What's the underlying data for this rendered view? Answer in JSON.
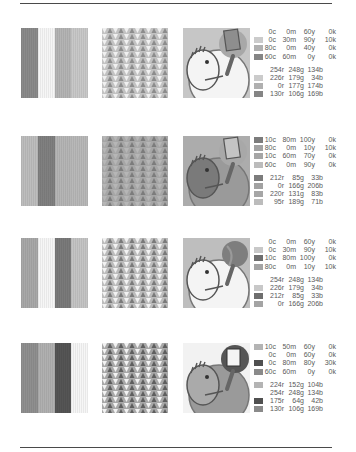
{
  "page": {
    "rules": [
      "top",
      "bottom"
    ]
  },
  "rows": [
    {
      "stripes": [
        "#8a8a8a",
        "#f6f6f6",
        "#b4b4b4",
        "#c8c8c8"
      ],
      "pattern": {
        "tri_dark": "#8c8c8c",
        "tri_light": "#f0f0f0",
        "bg": "#c2c2c2"
      },
      "illustration": {
        "bg": "#c6c6c6",
        "body": "#f4f4f4",
        "ring": "#f4f4f4",
        "accent": "#8e8e8e",
        "prop": "paddle"
      },
      "cmyk": [
        {
          "swatch": "#ffffff",
          "c": "0c",
          "m": "0m",
          "y": "60y",
          "k": "0k"
        },
        {
          "swatch": "#cbcbcb",
          "c": "0c",
          "m": "30m",
          "y": "90y",
          "k": "10k"
        },
        {
          "swatch": "#b0b0b0",
          "c": "80c",
          "m": "0m",
          "y": "40y",
          "k": "0k"
        },
        {
          "swatch": "#858585",
          "c": "60c",
          "m": "60m",
          "y": "0y",
          "k": "0k"
        }
      ],
      "rgb": [
        {
          "swatch": "#ffffff",
          "r": "254r",
          "g": "248g",
          "b": "134b"
        },
        {
          "swatch": "#cbcbcb",
          "r": "226r",
          "g": "179g",
          "b": "34b"
        },
        {
          "swatch": "#b0b0b0",
          "r": "0r",
          "g": "177g",
          "b": "174b"
        },
        {
          "swatch": "#858585",
          "r": "130r",
          "g": "106g",
          "b": "169b"
        }
      ]
    },
    {
      "stripes": [
        "#bdbdbd",
        "#808080",
        "#b5b5b5",
        "#b8b8b8"
      ],
      "pattern": {
        "tri_dark": "#7c7c7c",
        "tri_light": "#b6b6b6",
        "bg": "#a6a6a6"
      },
      "illustration": {
        "bg": "#acacac",
        "body": "#7a7a7a",
        "ring": "#9a9a9a",
        "accent": "#c4c4c4",
        "prop": "paddle"
      },
      "cmyk": [
        {
          "swatch": "#7c7c7c",
          "c": "10c",
          "m": "80m",
          "y": "100y",
          "k": "0k"
        },
        {
          "swatch": "#a2a2a2",
          "c": "80c",
          "m": "0m",
          "y": "10y",
          "k": "10k"
        },
        {
          "swatch": "#a6a6a6",
          "c": "10c",
          "m": "60m",
          "y": "70y",
          "k": "0k"
        },
        {
          "swatch": "#bcbcbc",
          "c": "60c",
          "m": "0m",
          "y": "90y",
          "k": "0k"
        }
      ],
      "rgb": [
        {
          "swatch": "#7c7c7c",
          "r": "212r",
          "g": "85g",
          "b": "33b"
        },
        {
          "swatch": "#a2a2a2",
          "r": "0r",
          "g": "166g",
          "b": "206b"
        },
        {
          "swatch": "#a6a6a6",
          "r": "220r",
          "g": "131g",
          "b": "83b"
        },
        {
          "swatch": "#bcbcbc",
          "r": "95r",
          "g": "189g",
          "b": "71b"
        }
      ]
    },
    {
      "stripes": [
        "#a8a8a8",
        "#f6f6f6",
        "#7a7a7a",
        "#c4c4c4"
      ],
      "pattern": {
        "tri_dark": "#7a7a7a",
        "tri_light": "#f2f2f2",
        "bg": "#bcbcbc"
      },
      "illustration": {
        "bg": "#bebebe",
        "body": "#f4f4f4",
        "ring": "#f4f4f4",
        "accent": "#7e7e7e",
        "prop": "ball"
      },
      "cmyk": [
        {
          "swatch": "#ffffff",
          "c": "0c",
          "m": "0m",
          "y": "60y",
          "k": "0k"
        },
        {
          "swatch": "#c8c8c8",
          "c": "0c",
          "m": "30m",
          "y": "90y",
          "k": "10k"
        },
        {
          "swatch": "#6e6e6e",
          "c": "10c",
          "m": "80m",
          "y": "100y",
          "k": "0k"
        },
        {
          "swatch": "#a4a4a4",
          "c": "80c",
          "m": "0m",
          "y": "10y",
          "k": "10k"
        }
      ],
      "rgb": [
        {
          "swatch": "#ffffff",
          "r": "254r",
          "g": "248g",
          "b": "134b"
        },
        {
          "swatch": "#c8c8c8",
          "r": "226r",
          "g": "179g",
          "b": "34b"
        },
        {
          "swatch": "#6e6e6e",
          "r": "212r",
          "g": "85g",
          "b": "33b"
        },
        {
          "swatch": "#a4a4a4",
          "r": "0r",
          "g": "166g",
          "b": "206b"
        }
      ]
    },
    {
      "stripes": [
        "#8f8f8f",
        "#b0b0b0",
        "#555555",
        "#f6f6f6"
      ],
      "pattern": {
        "tri_dark": "#5e5e5e",
        "tri_light": "#f2f2f2",
        "bg": "#a8a8a8"
      },
      "illustration": {
        "bg": "#f2f2f2",
        "body": "#aaaaaa",
        "ring": "#9a9a9a",
        "accent": "#555555",
        "prop": "paddle-dark"
      },
      "cmyk": [
        {
          "swatch": "#b4b4b4",
          "c": "10c",
          "m": "50m",
          "y": "60y",
          "k": "0k"
        },
        {
          "swatch": "#ffffff",
          "c": "0c",
          "m": "0m",
          "y": "60y",
          "k": "0k"
        },
        {
          "swatch": "#505050",
          "c": "0c",
          "m": "80m",
          "y": "80y",
          "k": "30k"
        },
        {
          "swatch": "#8a8a8a",
          "c": "60c",
          "m": "60m",
          "y": "0y",
          "k": "0k"
        }
      ],
      "rgb": [
        {
          "swatch": "#b4b4b4",
          "r": "224r",
          "g": "152g",
          "b": "104b"
        },
        {
          "swatch": "#ffffff",
          "r": "254r",
          "g": "248g",
          "b": "134b"
        },
        {
          "swatch": "#505050",
          "r": "175r",
          "g": "64g",
          "b": "42b"
        },
        {
          "swatch": "#8a8a8a",
          "r": "130r",
          "g": "106g",
          "b": "169b"
        }
      ]
    }
  ]
}
